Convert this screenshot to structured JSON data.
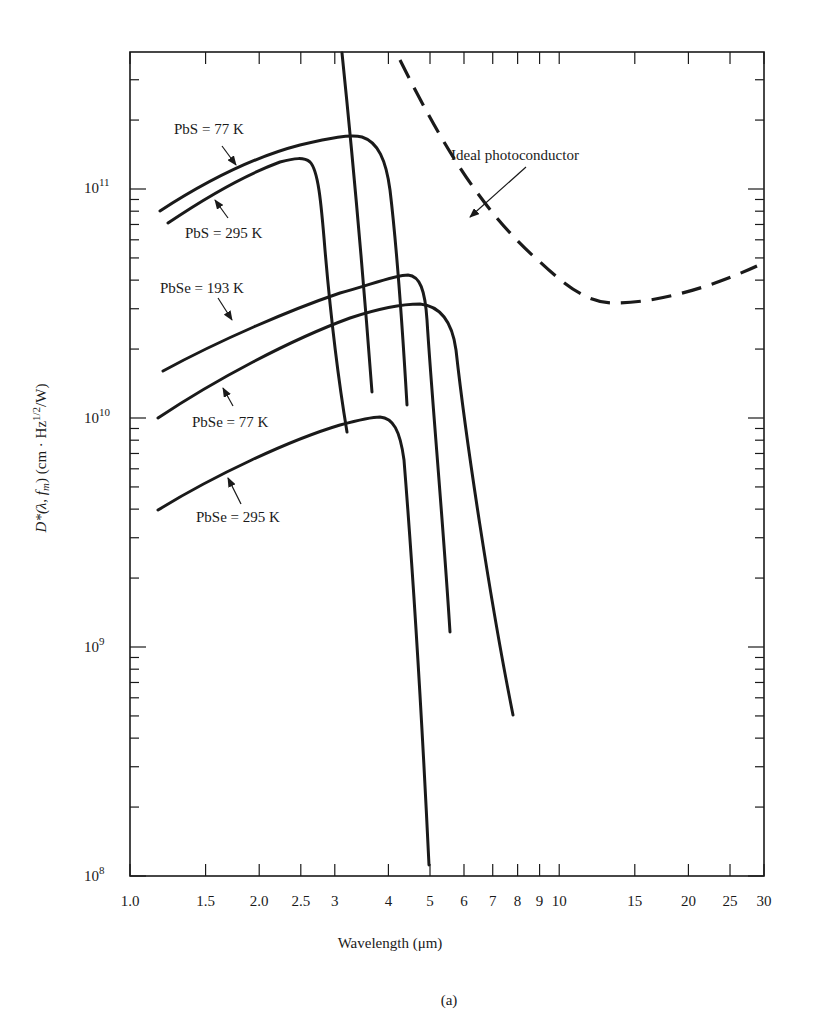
{
  "chart_data": {
    "type": "line",
    "title": "",
    "caption": "(a)",
    "xlabel": "Wavelength (μm)",
    "ylabel": "D*(λ, f_m) (cm · Hz^1/2/W)",
    "xscale": "log",
    "yscale": "log",
    "xlim": [
      1.0,
      30
    ],
    "ylim": [
      100000000.0,
      400000000000.0
    ],
    "grid": false,
    "legend_position": "inline annotations with arrows",
    "x_ticks": [
      "1.0",
      "1.5",
      "2.0",
      "2.5",
      "3",
      "4",
      "5",
      "6",
      "7",
      "8",
      "9",
      "10",
      "15",
      "20",
      "25",
      "30"
    ],
    "x_tick_values": [
      1.0,
      1.5,
      2.0,
      2.5,
      3,
      4,
      5,
      6,
      7,
      8,
      9,
      10,
      15,
      20,
      25,
      30
    ],
    "y_ticks": [
      "10^8",
      "10^9",
      "10^10",
      "10^11"
    ],
    "y_tick_values": [
      100000000.0,
      1000000000.0,
      10000000000.0,
      100000000000.0
    ],
    "series": [
      {
        "name": "PbS = 77 K",
        "style": "solid",
        "x": [
          1.17,
          1.5,
          2.0,
          2.5,
          3.0,
          3.3,
          3.5,
          3.7,
          3.9,
          4.1,
          4.3
        ],
        "y": [
          76000000000.0,
          100000000000.0,
          130000000000.0,
          150000000000.0,
          160000000000.0,
          160000000000.0,
          145000000000.0,
          90000000000.0,
          40000000000.0,
          20000000000.0,
          11000000000.0
        ]
      },
      {
        "name": "PbS = 295 K",
        "style": "solid",
        "x": [
          1.22,
          1.5,
          2.0,
          2.4,
          2.6,
          2.75,
          2.9,
          3.05,
          3.2,
          3.35
        ],
        "y": [
          65000000000.0,
          85000000000.0,
          110000000000.0,
          125000000000.0,
          125000000000.0,
          100000000000.0,
          50000000000.0,
          25000000000.0,
          13000000000.0,
          8500000000.0
        ]
      },
      {
        "name": "PbSe = 193 K",
        "style": "solid",
        "x": [
          1.2,
          1.5,
          2.0,
          2.5,
          3.0,
          3.5,
          4.0,
          4.3,
          4.6,
          4.9,
          5.2,
          5.5,
          5.7
        ],
        "y": [
          16000000000.0,
          19000000000.0,
          24000000000.0,
          29000000000.0,
          34000000000.0,
          38000000000.0,
          40000000000.0,
          37000000000.0,
          22000000000.0,
          10000000000.0,
          4000000000.0,
          1800000000.0,
          1150000000.0
        ]
      },
      {
        "name": "PbSe = 77 K",
        "style": "solid",
        "x": [
          1.18,
          1.5,
          2.0,
          2.5,
          3.0,
          3.5,
          4.0,
          4.6,
          5.0,
          5.5,
          6.0,
          6.5,
          7.0,
          7.5,
          8.0
        ],
        "y": [
          10000000000.0,
          13000000000.0,
          17000000000.0,
          21000000000.0,
          25000000000.0,
          28000000000.0,
          30000000000.0,
          30000000000.0,
          26000000000.0,
          15000000000.0,
          6500000000.0,
          3000000000.0,
          1500000000.0,
          800000000.0,
          500000000.0
        ]
      },
      {
        "name": "PbSe = 295 K",
        "style": "solid",
        "x": [
          1.18,
          1.5,
          2.0,
          2.5,
          3.0,
          3.5,
          3.8,
          4.1,
          4.4,
          4.6,
          4.8,
          4.95,
          5.05
        ],
        "y": [
          4000000000.0,
          5000000000.0,
          6500000000.0,
          8000000000.0,
          9200000000.0,
          10000000000.0,
          10000000000.0,
          8000000000.0,
          3500000000.0,
          1200000000.0,
          400000000.0,
          200000000.0,
          110000000.0
        ]
      },
      {
        "name": "Ideal photoconductor",
        "style": "dashed",
        "x": [
          3.8,
          4.5,
          5.5,
          6.5,
          8.0,
          10,
          12,
          14,
          17,
          20,
          25,
          30
        ],
        "y": [
          370000000000.0,
          240000000000.0,
          130000000000.0,
          80000000000.0,
          52000000000.0,
          37000000000.0,
          32000000000.0,
          31000000000.0,
          32000000000.0,
          34000000000.0,
          39000000000.0,
          45000000000.0
        ]
      },
      {
        "name": "unlabeled steep cutoff line",
        "style": "solid",
        "x": [
          3.1,
          3.3,
          3.5,
          3.7,
          3.8
        ],
        "y": [
          400000000000.0,
          150000000000.0,
          60000000000.0,
          22000000000.0,
          13000000000.0
        ]
      }
    ],
    "annotations": [
      {
        "text": "PbS = 77 K",
        "arrow_to": [
          2.0,
          130000000000.0
        ]
      },
      {
        "text": "PbS = 295 K",
        "arrow_to": [
          1.8,
          100000000000.0
        ]
      },
      {
        "text": "PbSe = 193 K",
        "arrow_to": [
          1.8,
          21000000000.0
        ]
      },
      {
        "text": "PbSe = 77 K",
        "arrow_to": [
          1.75,
          16000000000.0
        ]
      },
      {
        "text": "PbSe = 295 K",
        "arrow_to": [
          1.8,
          6000000000.0
        ]
      },
      {
        "text": "Ideal photoconductor",
        "arrow_to": [
          7.4,
          68000000000.0
        ]
      }
    ]
  },
  "labels": {
    "x_axis_title": "Wavelength (μm)",
    "y_axis_main": "D*(λ, f",
    "y_axis_sub": "m",
    "y_axis_rest": ") (cm · Hz",
    "y_axis_sup": "1/2",
    "y_axis_end": "/W)",
    "caption": "(a)",
    "curve_pbs77": "PbS = 77 K",
    "curve_pbs295": "PbS = 295 K",
    "curve_pbse193": "PbSe = 193 K",
    "curve_pbse77": "PbSe = 77 K",
    "curve_pbse295": "PbSe = 295 K",
    "curve_ideal": "Ideal photoconductor",
    "y_tick_base": "10",
    "y_tick_exp": [
      "8",
      "9",
      "10",
      "11"
    ],
    "x_ticks": [
      "1.0",
      "1.5",
      "2.0",
      "2.5",
      "3",
      "4",
      "5",
      "6",
      "7",
      "8",
      "9",
      "10",
      "15",
      "20",
      "25",
      "30"
    ]
  }
}
